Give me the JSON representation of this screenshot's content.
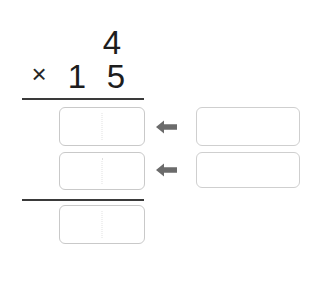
{
  "problem": {
    "top_number_digits": [
      "4"
    ],
    "operator": "×",
    "bottom_number_digits": [
      "1",
      "5"
    ],
    "top_ones": "4",
    "bottom_tens": "1",
    "bottom_ones": "5"
  },
  "answer_boxes": {
    "partial_1": {
      "left_cell": "",
      "right_cell": ""
    },
    "partial_2": {
      "left_cell": "",
      "right_cell": ""
    },
    "total": {
      "left_cell": "",
      "right_cell": ""
    }
  },
  "work_boxes": {
    "row_1": "",
    "row_2": ""
  },
  "icons": {
    "arrow_1": "arrow-left-icon",
    "arrow_2": "arrow-left-icon"
  },
  "colors": {
    "digit": "#1d1d1d",
    "rule": "#3a3a3a",
    "box_border": "#c9c9c9",
    "work_box_border": "#cfcfcf",
    "divider": "#e0e0e0",
    "arrow": "#6b6b6b",
    "background": "#ffffff"
  }
}
